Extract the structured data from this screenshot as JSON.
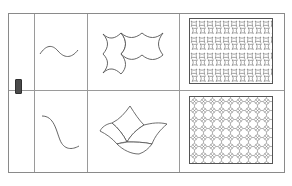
{
  "figure": {
    "background_color": "#ffffff",
    "frame_color": "#8a8a8a",
    "grid_line_color": "#9a9a9a",
    "stroke_color": "#555555",
    "marker_color": "#4a4a4a",
    "columns": 4,
    "rows": 2,
    "column_dividers_x": [
      33,
      86,
      178
    ],
    "row_divider_y": 89
  },
  "marker": {
    "name": "row-marker",
    "label": ""
  },
  "rows": [
    {
      "id": "row-1",
      "curve": {
        "name": "wavy-curve",
        "description": "horizontal sinusoidal wave",
        "label": ""
      },
      "tile": {
        "name": "bone-tile-pair",
        "description": "two bone / hourglass shaped tiles joined side by side",
        "label": ""
      },
      "pattern": {
        "name": "basketweave-tessellation",
        "description": "bone shaped tiles in alternating horizontal and vertical basketweave arrangement",
        "label": "",
        "columns": 6,
        "rows": 7
      }
    },
    {
      "id": "row-2",
      "curve": {
        "name": "s-curve",
        "description": "vertical S shaped curve",
        "label": ""
      },
      "tile": {
        "name": "curved-quad-tile-cluster",
        "description": "four curved quadrilateral tiles in a pinwheel cluster",
        "label": ""
      },
      "pattern": {
        "name": "pinwheel-tessellation",
        "description": "dense pinwheel arrangement of curved quadrilateral tiles",
        "label": "",
        "columns": 9,
        "rows": 9
      }
    }
  ]
}
